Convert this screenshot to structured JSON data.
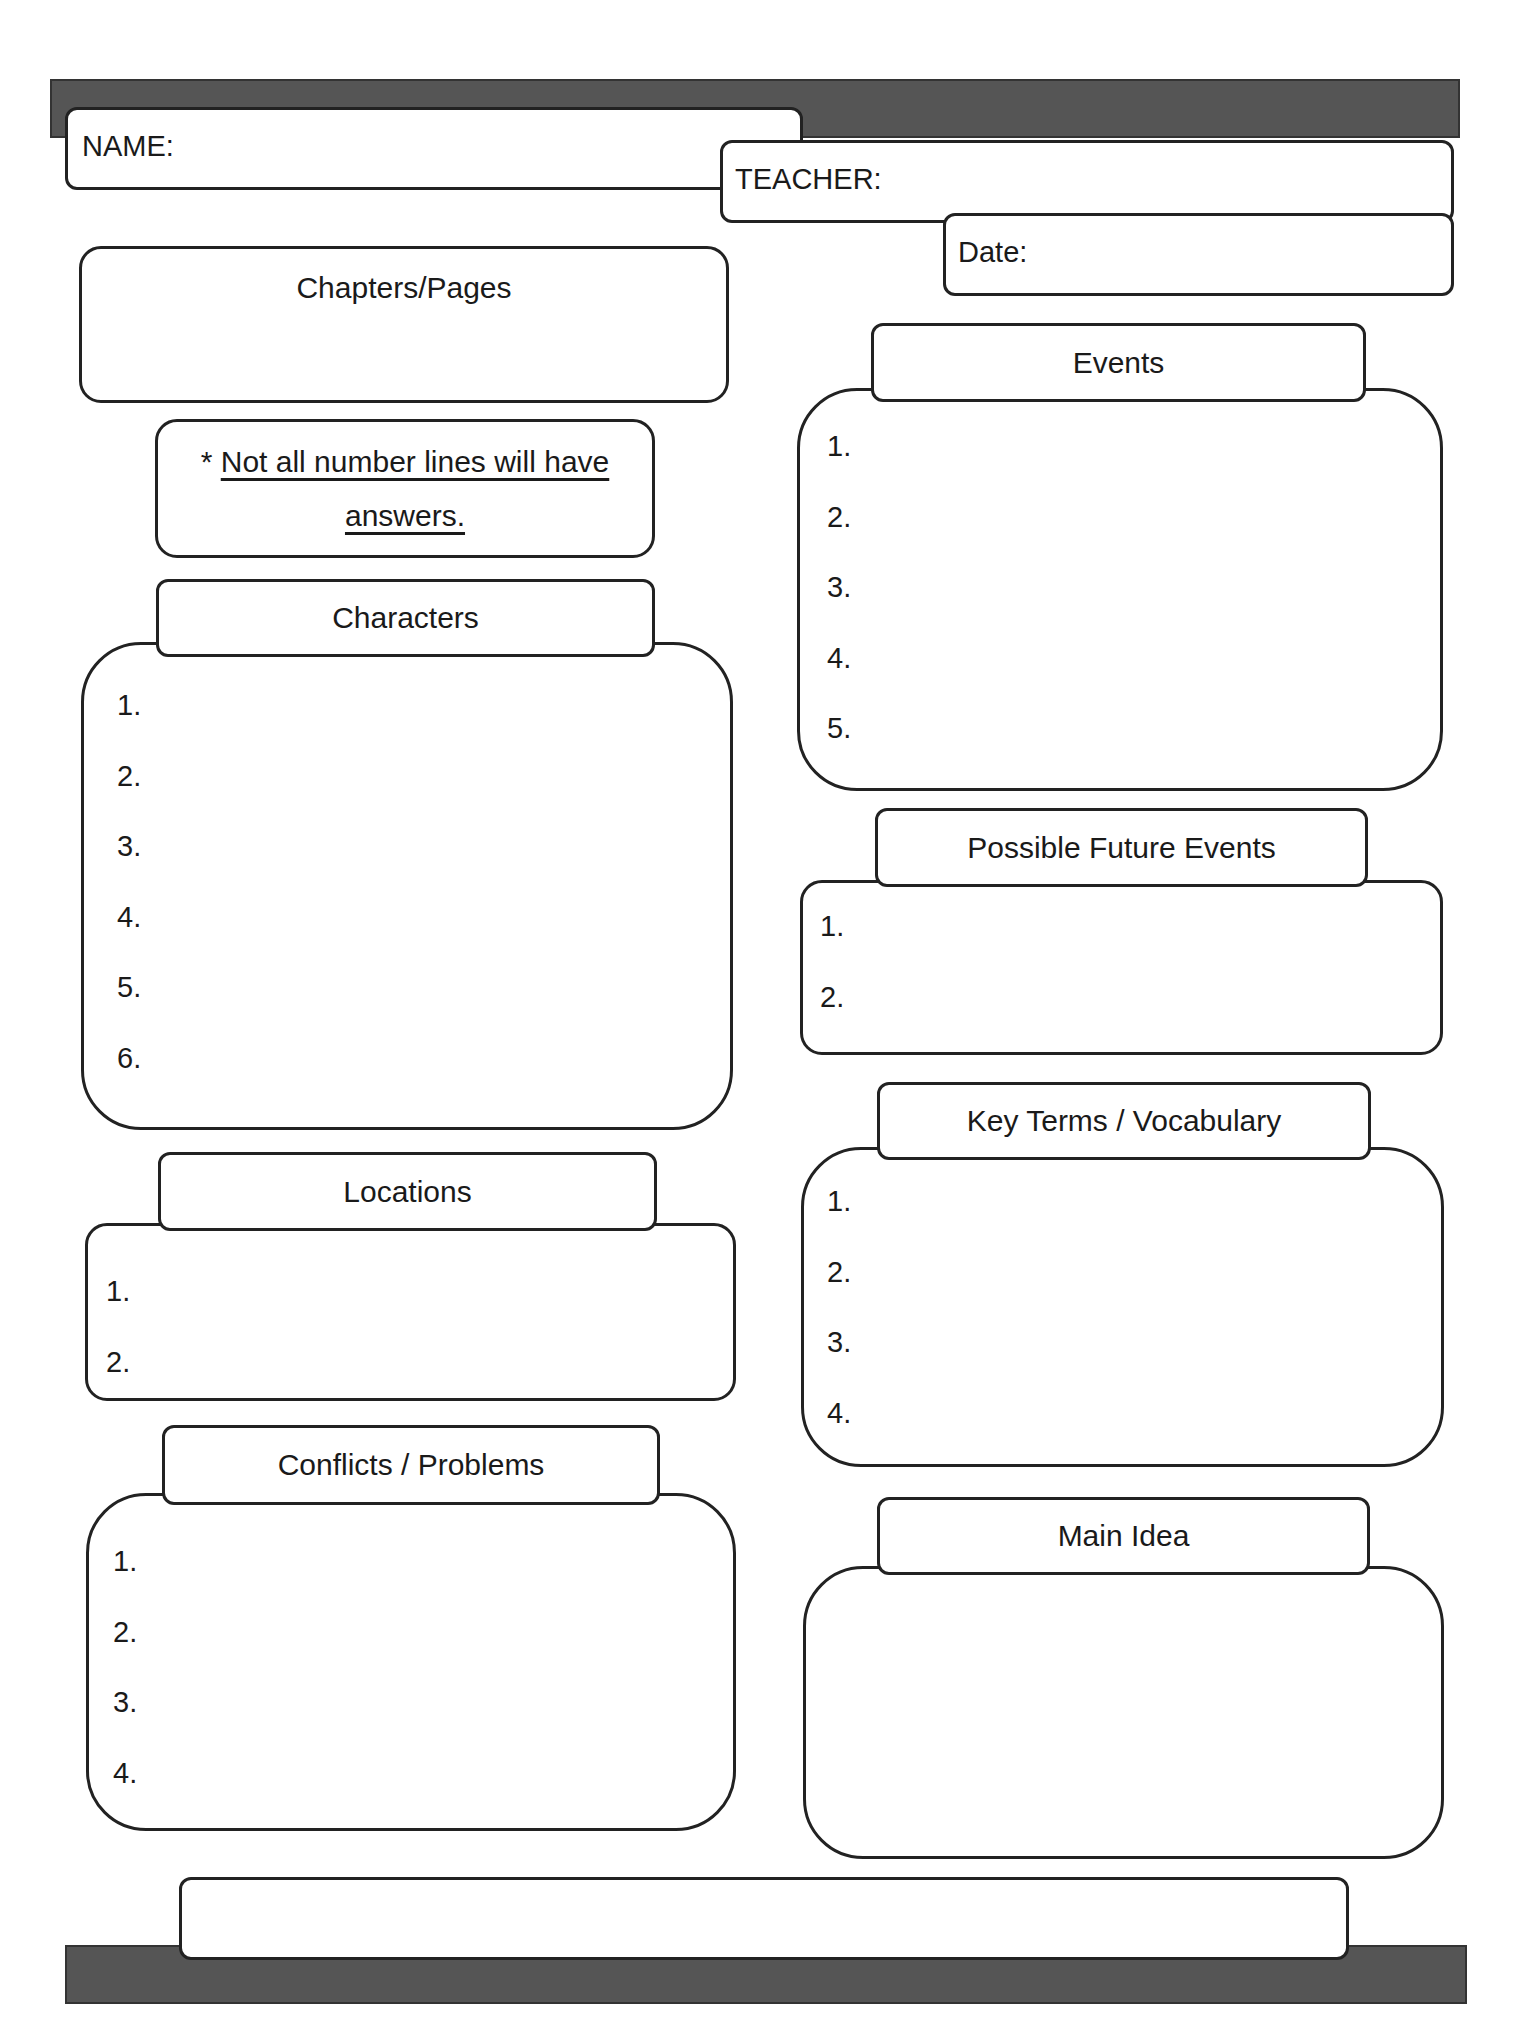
{
  "header": {
    "name_label": "NAME:",
    "teacher_label": "TEACHER:",
    "date_label": "Date:"
  },
  "chapters": {
    "title": "Chapters/Pages"
  },
  "note": {
    "asterisk": "*",
    "line1": "Not all number lines will have",
    "line2": "answers."
  },
  "characters": {
    "title": "Characters",
    "items": [
      "1.",
      "2.",
      "3.",
      "4.",
      "5.",
      "6."
    ]
  },
  "locations": {
    "title": "Locations",
    "items": [
      "1.",
      "2."
    ]
  },
  "conflicts": {
    "title": "Conflicts / Problems",
    "items": [
      "1.",
      "2.",
      "3.",
      "4."
    ]
  },
  "events": {
    "title": "Events",
    "items": [
      "1.",
      "2.",
      "3.",
      "4.",
      "5."
    ]
  },
  "future_events": {
    "title": "Possible Future Events",
    "items": [
      "1.",
      "2."
    ]
  },
  "key_terms": {
    "title": "Key Terms / Vocabulary",
    "items": [
      "1.",
      "2.",
      "3.",
      "4."
    ]
  },
  "main_idea": {
    "title": "Main Idea"
  },
  "colors": {
    "bar": "#555555",
    "border": "#222222",
    "text": "#1a1a1a"
  }
}
